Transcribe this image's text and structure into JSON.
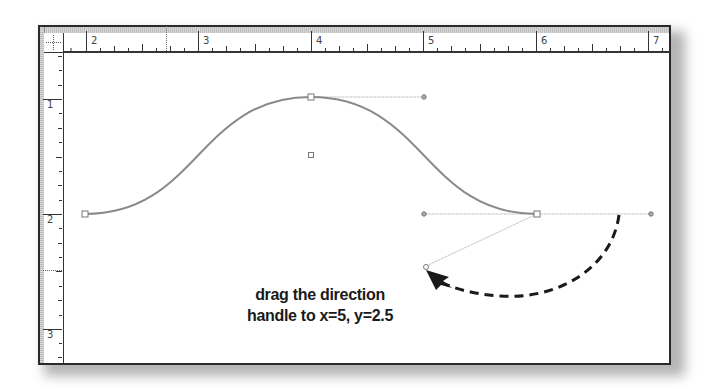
{
  "canvas": {
    "rulers": {
      "horizontal_labels": [
        "2",
        "3",
        "4",
        "5",
        "6",
        "7"
      ],
      "vertical_labels": [
        "1",
        "2",
        "3"
      ],
      "unit_px": 112.5
    },
    "path": {
      "anchors": [
        {
          "name": "start-anchor",
          "x": 85,
          "y": 214
        },
        {
          "name": "peak-anchor",
          "x": 311,
          "y": 97
        },
        {
          "name": "end-anchor",
          "x": 537,
          "y": 214
        }
      ],
      "handles": [
        {
          "name": "peak-handle-right",
          "x": 424,
          "y": 97
        },
        {
          "name": "end-handle-left",
          "x": 424,
          "y": 214
        },
        {
          "name": "end-handle-right",
          "x": 651,
          "y": 214
        },
        {
          "name": "dragged-handle",
          "x": 424,
          "y": 267
        }
      ],
      "center_point": {
        "x": 311,
        "y": 155
      }
    },
    "colors": {
      "curve": "#8a8a8a",
      "handle_line": "#b0b0b0",
      "arrow": "#1a1a1a",
      "frame": "#2a2a2a"
    }
  },
  "annotation": {
    "line1": "drag the direction",
    "line2": "handle to x=5, y=2.5"
  }
}
